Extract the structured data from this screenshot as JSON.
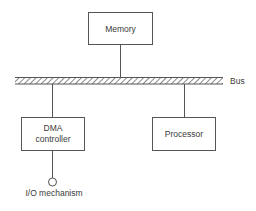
{
  "diagram": {
    "bus": {
      "label": "Bus"
    },
    "nodes": {
      "memory": {
        "label": "Memory"
      },
      "dma": {
        "line1": "DMA",
        "line2": "controller"
      },
      "processor": {
        "label": "Processor"
      },
      "io": {
        "label": "I/O mechanism"
      }
    },
    "edges": [
      {
        "from": "memory",
        "to": "bus"
      },
      {
        "from": "dma",
        "to": "bus"
      },
      {
        "from": "processor",
        "to": "bus"
      },
      {
        "from": "dma",
        "to": "io"
      }
    ],
    "colors": {
      "stroke": "#555555",
      "text": "#3a3a3a",
      "background": "#ffffff"
    }
  }
}
